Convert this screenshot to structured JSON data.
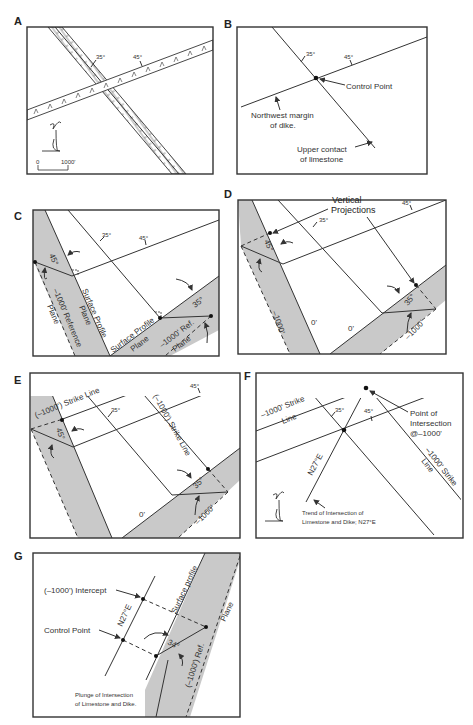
{
  "panels": {
    "A": {
      "label": "A",
      "limestone_dip": "35°",
      "dike_dip": "45°",
      "scale_start": "0",
      "scale_end": "1000'",
      "north_arrow": "north-arrow-icon"
    },
    "B": {
      "label": "B",
      "limestone_dip": "35°",
      "dike_dip": "45°",
      "control_point": "Control Point",
      "dike_margin": [
        "Northwest margin",
        "of dike."
      ],
      "limestone_contact": [
        "Upper contact",
        "of limestone"
      ]
    },
    "C": {
      "label": "C",
      "limestone_dip": "35°",
      "dike_dip": "45°",
      "dike_angle": "45°",
      "limestone_angle": "35°",
      "left_profile": [
        "Surface Profile",
        "Plane"
      ],
      "left_reference": [
        "–1000' Reference",
        "Plane"
      ],
      "right_profile": [
        "Surface Profile",
        "Plane"
      ],
      "right_reference": [
        "–1000' Ref.",
        "Plane"
      ]
    },
    "D": {
      "label": "D",
      "title": [
        "Vertical",
        "Projections"
      ],
      "limestone_dip": "35°",
      "dike_dip": "45°",
      "dike_angle": "45°",
      "limestone_angle": "35°",
      "left_depth": "–1000'",
      "left_zero": "0'",
      "right_zero": "0'",
      "right_depth": "–1000'"
    },
    "E": {
      "label": "E",
      "left_strike": "(–1000') Strike Line",
      "right_strike": "(–1000') Strike Line",
      "limestone_dip": "35°",
      "dike_dip": "45°",
      "dike_angle": "45°",
      "limestone_angle": "35°",
      "zero": "0'",
      "depth": "–1000'"
    },
    "F": {
      "label": "F",
      "left_strike": [
        "–1000' Strike",
        "Line"
      ],
      "right_strike": [
        "–1000' Strike",
        "Line"
      ],
      "limestone_dip": "35°",
      "dike_dip": "45°",
      "intersection": [
        "Point of",
        "Intersection",
        "@–1000'"
      ],
      "trend_label": "N27°E",
      "trend_note": [
        "Trend of Intersection of",
        "Limestone and Dike; N27°E"
      ],
      "north_arrow": "north-arrow-icon"
    },
    "G": {
      "label": "G",
      "intercept": "(–1000') Intercept",
      "control_point": "Control Point",
      "trend_label": "N27°E",
      "surface_profile": "Surface profile",
      "reference_plane": "(–1000') Ref.",
      "plane": "Plane",
      "plunge_angle": "34°",
      "plunge_note": [
        "Plunge of Intersection",
        "of Limestone and Dike."
      ]
    }
  }
}
